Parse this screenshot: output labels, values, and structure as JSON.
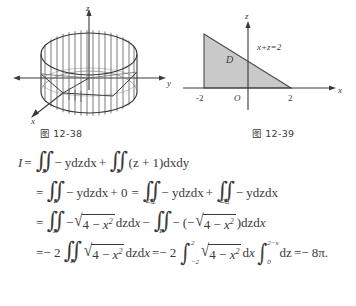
{
  "figures": [
    {
      "id": "fig-12-38",
      "caption": "图 12-38",
      "axes": [
        {
          "name": "z-axis-label",
          "label": "z"
        },
        {
          "name": "y-axis-label",
          "label": "y"
        },
        {
          "name": "x-axis-label",
          "label": "x"
        }
      ],
      "description": "hatched cylinder surface cut by plane, 3D coordinate axes"
    },
    {
      "id": "fig-12-39",
      "caption": "图 12-39",
      "axes": [
        {
          "name": "z-axis-label",
          "label": "z"
        },
        {
          "name": "x-axis-label",
          "label": "x"
        }
      ],
      "region_label": "D",
      "line_label": "x+z=2",
      "origin_label": "O",
      "tick_left": "-2",
      "tick_right": "2",
      "shade_color": "#c9c9c9"
    }
  ],
  "equations": {
    "line1": {
      "lhs": "I",
      "eq": "=",
      "int1_limit": "Σ",
      "int1_body": "− ydzdx",
      "plus": "+",
      "int2_limit": "Σ",
      "int2_body": "(z + 1)dxdy"
    },
    "line2": {
      "eq1": "=",
      "int1_limit": "Σ",
      "int1_body": "− ydzdx",
      "plus0": "+ 0",
      "eq2": "=",
      "int2_limit": "Σ左",
      "int2_body": "− ydzdx",
      "plus": "+",
      "int3_limit": "Σ右",
      "int3_body": "− ydzdx"
    },
    "line3": {
      "eq": "=",
      "int1_limit": "D",
      "int1_body": "−√(4 − x²) dzdx",
      "minus": "−",
      "int2_limit": "D",
      "int2_body": "− (−√(4 − x²))dzdx"
    },
    "line4": {
      "eq": "=− 2",
      "int1_limit": "D",
      "int1_body": "√(4 − x²) dzdx",
      "eq2": "=− 2",
      "int2_lower": "−2",
      "int2_upper": "2",
      "int2_body": "√(4 − x²) dx",
      "int3_lower": "0",
      "int3_upper": "2−x",
      "int3_body": "dz",
      "result": "=− 8π."
    }
  },
  "symbols": {
    "sqrt_radical": "√",
    "double_integral": "∬",
    "single_integral": "∫",
    "sigma": "Σ",
    "pi": "π",
    "radicand": "4 − x",
    "exponent": "2"
  }
}
